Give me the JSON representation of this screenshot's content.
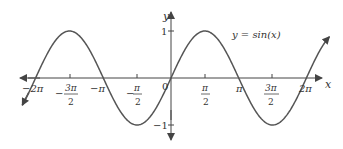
{
  "chart_data": {
    "type": "line",
    "title": "",
    "function_label": "y = sin(x)",
    "xlabel": "x",
    "ylabel": "y",
    "x_range": [
      -6.9,
      7.35
    ],
    "y_range": [
      -1.4,
      1.25
    ],
    "xlim_ticks": [
      "-2π",
      "-3π/2",
      "-π",
      "-π/2",
      "0",
      "π/2",
      "π",
      "3π/2",
      "2π"
    ],
    "x_tick_values": [
      -6.2832,
      -4.7124,
      -3.1416,
      -1.5708,
      0,
      1.5708,
      3.1416,
      4.7124,
      6.2832
    ],
    "y_ticks": [
      "1",
      "-1"
    ],
    "y_tick_values": [
      1,
      -1
    ],
    "series": [
      {
        "name": "y = sin(x)",
        "x": [
          -6.9,
          -6.2832,
          -4.7124,
          -3.1416,
          -1.5708,
          0,
          1.5708,
          3.1416,
          4.7124,
          6.2832,
          7.35
        ],
        "y": [
          -0.578,
          0,
          1,
          0,
          -1,
          0,
          1,
          0,
          -1,
          0,
          0.876
        ]
      }
    ],
    "grid": false,
    "legend": "none"
  },
  "labels": {
    "function": "y = sin(x)",
    "x_axis": "x",
    "y_axis": "y",
    "origin": "0",
    "y_one": "1",
    "y_neg_one": "−1",
    "neg_2pi": "−2π",
    "neg_pi": "−π",
    "pi": "π",
    "two_pi": "2π",
    "pi_num": "π",
    "three_pi_num": "3π",
    "den": "2",
    "minus": "−"
  },
  "colors": {
    "curve": "#555555",
    "axis": "#444444",
    "text": "#333333"
  }
}
